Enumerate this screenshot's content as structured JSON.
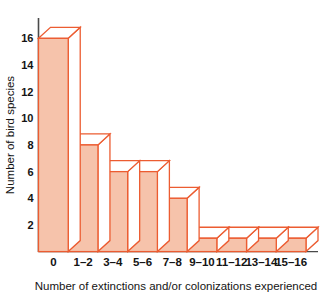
{
  "chart_data": {
    "type": "bar",
    "title": "",
    "subtitle": "",
    "xlabel": "Number of extinctions and/or colonizations experienced",
    "ylabel": "Number of bird species",
    "categories": [
      "0",
      "1–2",
      "3–4",
      "5–6",
      "7–8",
      "9–10",
      "11–12",
      "13–14",
      "15–16"
    ],
    "values": [
      16,
      8,
      6,
      6,
      4,
      1,
      1,
      1,
      1
    ],
    "ylim": [
      0,
      17
    ],
    "ytick_labels": [
      "2",
      "4",
      "6",
      "8",
      "10",
      "12",
      "14",
      "16"
    ],
    "ytick_values": [
      2,
      4,
      6,
      8,
      10,
      12,
      14,
      16
    ],
    "xlim": [
      0,
      9
    ],
    "grid": false,
    "legend": null,
    "legend_position": "none",
    "style": "3d-block-histogram",
    "colors": {
      "bar_fill": "#f6c3ab",
      "bar_edge": "#ec5c31",
      "bar_top_face": "#ffffff",
      "bar_side_face": "#ffffff",
      "axis": "#4a4a4a",
      "text": "#141414",
      "background": "#ffffff"
    },
    "annotations": []
  },
  "axes": {
    "y_axis_label": "Number of bird species",
    "x_axis_label": "Number of extinctions and/or colonizations experienced"
  }
}
